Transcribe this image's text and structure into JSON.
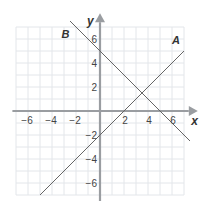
{
  "chart_data": {
    "type": "line",
    "title": "",
    "xlabel": "x",
    "ylabel": "y",
    "xlim": [
      -7,
      7.5
    ],
    "ylim": [
      -7.5,
      7.5
    ],
    "grid": true,
    "x_ticks": [
      -6,
      -4,
      -2,
      2,
      4,
      6
    ],
    "y_ticks": [
      -6,
      -4,
      -2,
      2,
      4,
      6
    ],
    "series": [
      {
        "name": "A",
        "equation": "y = x - 2",
        "x": [
          -5,
          7
        ],
        "y": [
          -7,
          5
        ]
      },
      {
        "name": "B",
        "equation": "y = -x + 5",
        "x": [
          -2.5,
          7.5
        ],
        "y": [
          7.5,
          -2.5
        ]
      }
    ]
  }
}
